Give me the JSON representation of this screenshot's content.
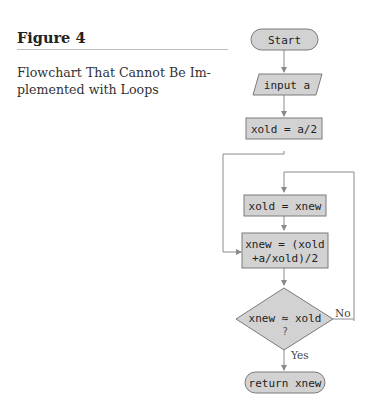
{
  "figure": {
    "label": "Figure 4",
    "caption_line1": "Flowchart That Cannot Be Im-",
    "caption_line2": "plemented with Loops"
  },
  "flowchart": {
    "start": "Start",
    "input": "input a",
    "init": "xold = a/2",
    "assign": "xold = xnew",
    "compute_line1": "xnew = (xold",
    "compute_line2": "+a/xold)/2",
    "decision_line1": "xnew ≈ xold",
    "decision_line2": "?",
    "no_label": "No",
    "yes_label": "Yes",
    "end": "return xnew"
  },
  "colors": {
    "shape_fill": "#d2d2d2",
    "shape_stroke": "#7a7a7a",
    "line": "#8a8a8a"
  }
}
